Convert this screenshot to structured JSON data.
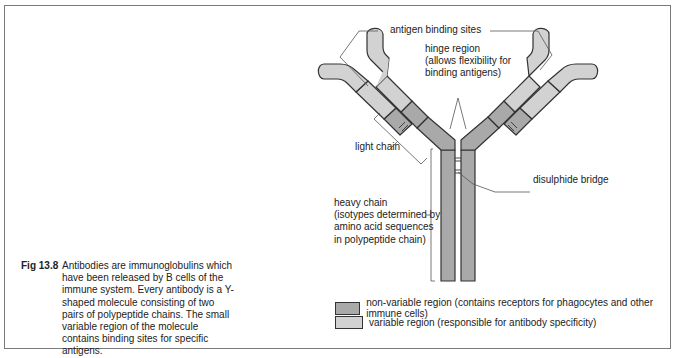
{
  "figure": {
    "label": "Fig 13.8",
    "caption": "Antibodies are immunoglobulins which have been released by B cells of the immune system. Every antibody is a Y-shaped molecule consisting of two pairs of polypeptide chains. The small variable region of the molecule contains binding sites for specific antigens."
  },
  "labels": {
    "antigen_binding_sites": "antigen binding sites",
    "hinge_region": [
      "hinge region",
      "(allows flexibility for",
      "binding antigens)"
    ],
    "light_chain": "light chain",
    "disulphide_bridge": "disulphide bridge",
    "heavy_chain": [
      "heavy chain",
      "(isotypes determined by",
      "amino acid sequences",
      "in polypeptide chain)"
    ]
  },
  "legend": [
    {
      "key": "non-variable",
      "label": "non-variable region (contains receptors for phagocytes and other immune cells)",
      "color": "#a9a9a9"
    },
    {
      "key": "variable",
      "label": "variable region (responsible for antibody specificity)",
      "color": "#d2d2d2"
    }
  ],
  "colors": {
    "non_variable": "#a9a9a9",
    "variable": "#d2d2d2",
    "outline": "#333333",
    "frame": "#7a7a7a"
  }
}
